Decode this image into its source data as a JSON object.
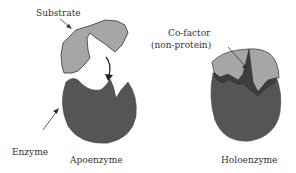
{
  "labels": {
    "substrate": "Substrate",
    "enzyme": "Enzyme",
    "apoenzyme": "Apoenzyme",
    "cofactor_line1": "Co-factor",
    "cofactor_line2": "(non-protein)",
    "holoenzyme": "Holoenzyme"
  },
  "colors": {
    "substrate": "#a6a6a6",
    "enzyme": "#555555",
    "cofactor": "#3d3d3d",
    "outline": "#333333"
  }
}
